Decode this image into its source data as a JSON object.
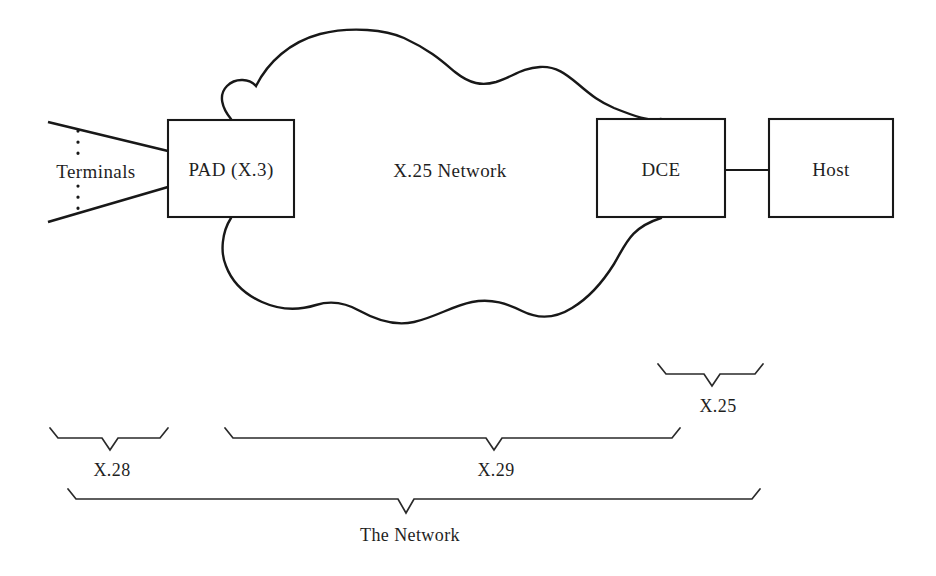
{
  "diagram": {
    "background_color": "#ffffff",
    "line_color": "#181818",
    "nodes": {
      "terminals": {
        "label": "Terminals",
        "x": 96,
        "y": 172
      },
      "pad": {
        "label": "PAD (X.3)",
        "x": 231,
        "y": 170
      },
      "cloud": {
        "label": "X.25 Network",
        "x": 450,
        "y": 171
      },
      "dce": {
        "label": "DCE",
        "x": 661,
        "y": 170
      },
      "host": {
        "label": "Host",
        "x": 831,
        "y": 170
      }
    },
    "braces": [
      {
        "name": "x25",
        "label": "X.25",
        "label_x": 718,
        "label_y": 406,
        "left": 658,
        "right": 763,
        "top": 364,
        "baseline": 374,
        "tip_x": 712,
        "tip_y": 386
      },
      {
        "name": "x28",
        "label": "X.28",
        "label_x": 112,
        "label_y": 470,
        "left": 50,
        "right": 168,
        "top": 428,
        "baseline": 438,
        "tip_x": 110,
        "tip_y": 450
      },
      {
        "name": "x29",
        "label": "X.29",
        "label_x": 496,
        "label_y": 470,
        "left": 225,
        "right": 680,
        "top": 428,
        "baseline": 438,
        "tip_x": 494,
        "tip_y": 450
      },
      {
        "name": "the-network",
        "label": "The Network",
        "label_x": 410,
        "label_y": 535,
        "left": 68,
        "right": 760,
        "top": 489,
        "baseline": 499,
        "tip_x": 406,
        "tip_y": 513
      }
    ]
  }
}
